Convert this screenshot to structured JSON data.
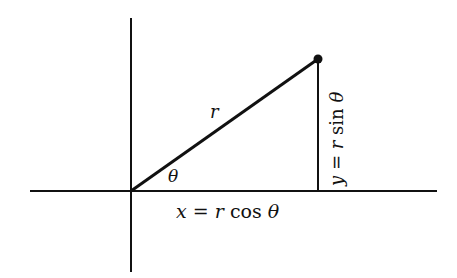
{
  "diagram": {
    "colors": {
      "background": "#ffffff",
      "ink": "#111111"
    },
    "axes": {
      "horizontal": {
        "x1": 30,
        "x2": 437,
        "y": 191
      },
      "vertical": {
        "x": 131,
        "y1": 18,
        "y2": 272
      }
    },
    "origin": {
      "x": 131,
      "y": 191
    },
    "point": {
      "x": 318,
      "y": 59
    },
    "labels": {
      "radius": "r",
      "angle": "θ",
      "x_eq": "x",
      "x_equals": "=",
      "x_r": "r",
      "x_cos": "cos",
      "x_theta": "θ",
      "y_eq": "y",
      "y_equals": "=",
      "y_r": "r",
      "y_sin": "sin",
      "y_theta": "θ"
    }
  }
}
